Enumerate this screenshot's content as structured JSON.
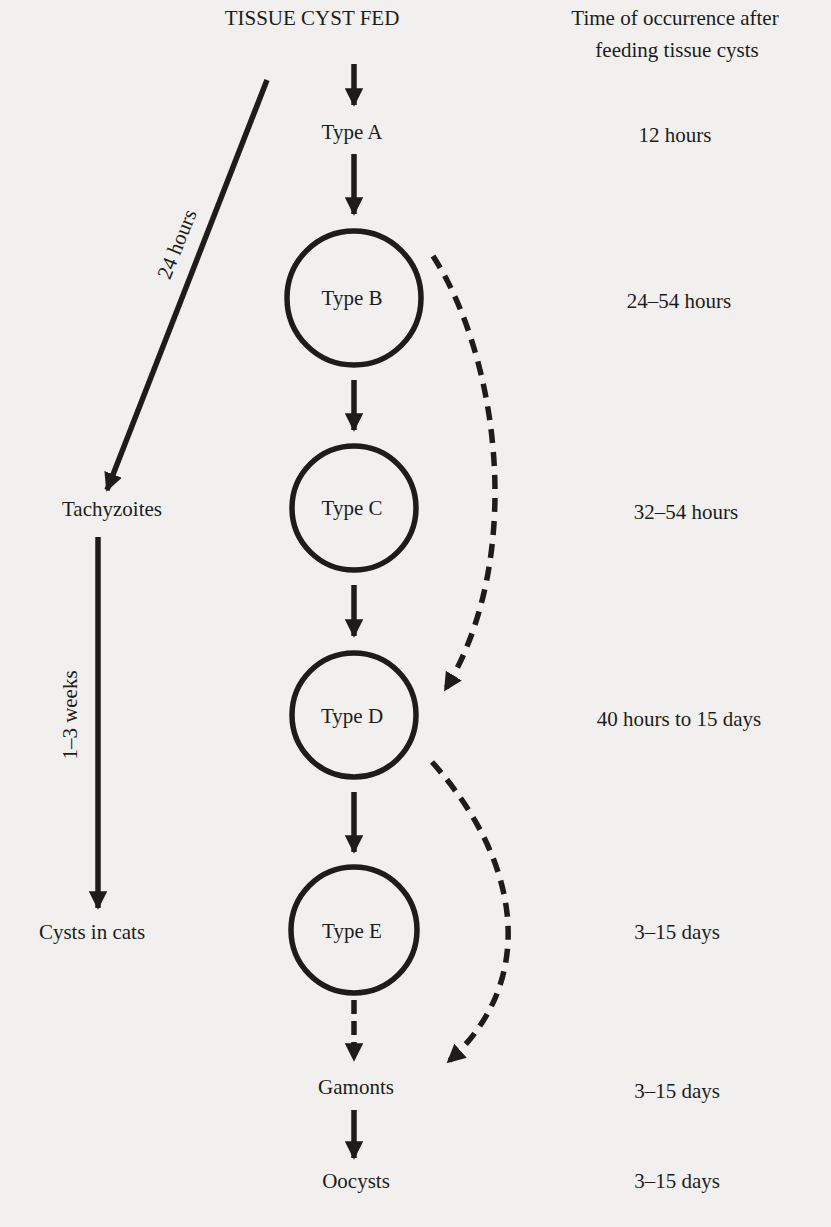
{
  "diagram": {
    "title": "TISSUE CYST FED",
    "time_header": [
      "Time of occurrence after",
      "feeding tissue cysts"
    ],
    "colors": {
      "ink": "#1c1c1c",
      "paper": "#f1f0ee"
    },
    "stages": [
      {
        "id": "type-a",
        "label": "Type A",
        "time": "12 hours",
        "circled": false
      },
      {
        "id": "type-b",
        "label": "Type B",
        "time": "24–54 hours",
        "circled": true
      },
      {
        "id": "type-c",
        "label": "Type C",
        "time": "32–54 hours",
        "circled": true
      },
      {
        "id": "type-d",
        "label": "Type D",
        "time": "40 hours to 15 days",
        "circled": true
      },
      {
        "id": "type-e",
        "label": "Type E",
        "time": "3–15 days",
        "circled": true
      },
      {
        "id": "gamonts",
        "label": "Gamonts",
        "time": "3–15 days",
        "circled": false
      },
      {
        "id": "oocysts",
        "label": "Oocysts",
        "time": "3–15 days",
        "circled": false
      }
    ],
    "side_branch": {
      "tachyzoites": "Tachyzoites",
      "cysts_in_cats": "Cysts in cats",
      "edge_24h": "24 hours",
      "edge_1_3w": "1–3 weeks"
    },
    "edges": [
      {
        "from": "tissue-cyst-fed",
        "to": "type-a",
        "style": "solid"
      },
      {
        "from": "type-a",
        "to": "type-b",
        "style": "solid"
      },
      {
        "from": "type-b",
        "to": "type-c",
        "style": "solid"
      },
      {
        "from": "type-c",
        "to": "type-d",
        "style": "solid"
      },
      {
        "from": "type-d",
        "to": "type-e",
        "style": "solid"
      },
      {
        "from": "type-e",
        "to": "gamonts",
        "style": "dashed"
      },
      {
        "from": "gamonts",
        "to": "oocysts",
        "style": "solid"
      },
      {
        "from": "type-b",
        "to": "type-d",
        "style": "dashed"
      },
      {
        "from": "type-d",
        "to": "gamonts",
        "style": "dashed"
      },
      {
        "from": "tissue-cyst-fed",
        "to": "tachyzoites",
        "style": "solid",
        "label": "24 hours"
      },
      {
        "from": "tachyzoites",
        "to": "cysts-in-cats",
        "style": "solid",
        "label": "1–3 weeks"
      }
    ]
  }
}
